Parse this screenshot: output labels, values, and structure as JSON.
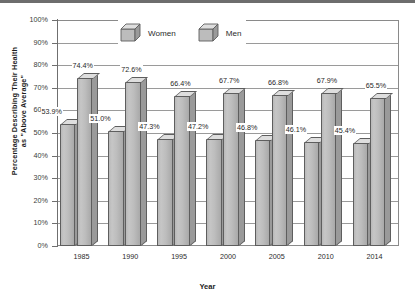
{
  "chart_data": {
    "type": "bar",
    "title": "",
    "subtitle": "",
    "xlabel": "Year",
    "ylabel": "Percentage Describing Their Health as \"Above Average\"",
    "ylabel_line1": "Percentage Describing Their Health",
    "ylabel_line2": "as \"Above Average\"",
    "categories": [
      "1985",
      "1990",
      "1995",
      "2000",
      "2005",
      "2010",
      "2014"
    ],
    "series": [
      {
        "name": "Women",
        "values": [
          53.9,
          51.0,
          47.3,
          47.2,
          46.8,
          46.1,
          45.4
        ],
        "labels": [
          "53.9%",
          "51.0%",
          "47.3%",
          "47.2%",
          "46.8%",
          "46.1%",
          "45.4%"
        ],
        "color": "#bdbdbd"
      },
      {
        "name": "Men",
        "values": [
          74.4,
          72.6,
          66.4,
          67.7,
          66.8,
          67.9,
          65.5
        ],
        "labels": [
          "74.4%",
          "72.6%",
          "66.4%",
          "67.7%",
          "66.8%",
          "67.9%",
          "65.5%"
        ],
        "color": "#bdbdbd"
      }
    ],
    "ylim": [
      0,
      100
    ],
    "yticks": [
      0,
      10,
      20,
      30,
      40,
      50,
      60,
      70,
      80,
      90,
      100
    ],
    "ytick_labels": [
      "0%",
      "10%",
      "20%",
      "30%",
      "40%",
      "50%",
      "60%",
      "70%",
      "80%",
      "90%",
      "100%"
    ],
    "grid": true,
    "legend_position": "top-center",
    "legend": [
      "Women",
      "Men"
    ],
    "style_3d": true
  },
  "legend": {
    "women_label": "Women",
    "men_label": "Men"
  },
  "axes": {
    "x_title": "Year",
    "y_title_line1": "Percentage Describing Their Health",
    "y_title_line2": "as \"Above Average\""
  },
  "colors": {
    "bar_face": "#bdbdbd",
    "bar_top": "#dedede",
    "bar_side": "#9a9a9a",
    "bar_edge": "#5e5e5e",
    "grid": "#9a9a9a",
    "text": "#1d1d1d"
  }
}
